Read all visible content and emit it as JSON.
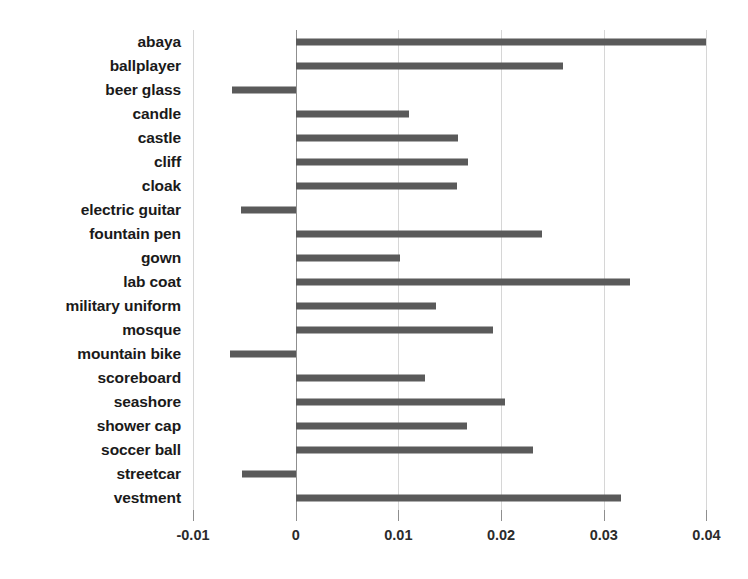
{
  "chart_data": {
    "type": "bar",
    "orientation": "horizontal",
    "title": "",
    "subtitle": "",
    "xlabel": "",
    "ylabel": "",
    "xlim": [
      -0.01,
      0.042
    ],
    "grid": true,
    "legend": null,
    "bar_color": "#5a5a5a",
    "gridline_color": "#d6d6d6",
    "zero_line_color": "#8f8f8f",
    "xticks": [
      -0.01,
      0,
      0.01,
      0.02,
      0.03,
      0.04
    ],
    "xticklabels": [
      "-0.01",
      "0",
      "0.01",
      "0.02",
      "0.03",
      "0.04"
    ],
    "categories": [
      "abaya",
      "ballplayer",
      "beer glass",
      "candle",
      "castle",
      "cliff",
      "cloak",
      "electric guitar",
      "fountain pen",
      "gown",
      "lab coat",
      "military uniform",
      "mosque",
      "mountain bike",
      "scoreboard",
      "seashore",
      "shower cap",
      "soccer ball",
      "streetcar",
      "vestment"
    ],
    "values": [
      0.04,
      0.026,
      -0.0062,
      0.011,
      0.0158,
      0.0168,
      0.0157,
      -0.0053,
      0.024,
      0.0102,
      0.0326,
      0.0137,
      0.0192,
      -0.0064,
      0.0126,
      0.0204,
      0.0167,
      0.0231,
      -0.0052,
      0.0317
    ]
  }
}
